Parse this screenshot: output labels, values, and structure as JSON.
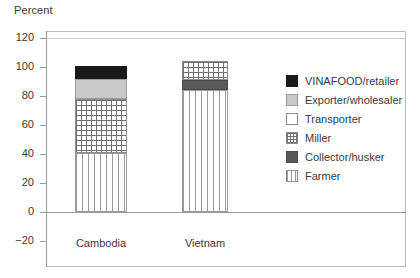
{
  "axis_title": "Percent",
  "chart_data": {
    "type": "bar",
    "title": "",
    "xlabel": "",
    "ylabel": "Percent",
    "ylim": [
      -20,
      120
    ],
    "grid": false,
    "stacked": true,
    "legend_position": "right",
    "categories": [
      "Cambodia",
      "Vietnam"
    ],
    "yticks": [
      "120",
      "100",
      "80",
      "60",
      "40",
      "20",
      "0",
      "−20"
    ],
    "ytick_values": [
      120,
      100,
      80,
      60,
      40,
      20,
      0,
      -20
    ],
    "series": [
      {
        "name": "Farmer",
        "values": [
          41,
          84
        ]
      },
      {
        "name": "Collector/husker",
        "values": [
          0,
          7
        ]
      },
      {
        "name": "Miller",
        "values": [
          37,
          13
        ]
      },
      {
        "name": "Transporter",
        "values": [
          0,
          0
        ]
      },
      {
        "name": "Exporter/wholesaler",
        "values": [
          14,
          0
        ]
      },
      {
        "name": "VINAFOOD/retailer",
        "values": [
          9,
          0
        ]
      }
    ],
    "totals": [
      101,
      104
    ]
  },
  "legend": {
    "items": [
      {
        "label": "VINAFOOD/retailer",
        "key": "vinafood",
        "color": "#191919"
      },
      {
        "label": "Exporter/wholesaler",
        "key": "exporter",
        "color": "#c9c9c9"
      },
      {
        "label": "Transporter",
        "key": "transporter",
        "color": "#ffffff"
      },
      {
        "label": "Miller",
        "key": "miller",
        "color": "#ffffff"
      },
      {
        "label": "Collector/husker",
        "key": "collector",
        "color": "#595959"
      },
      {
        "label": "Farmer",
        "key": "farmer",
        "color": "#ffffff"
      }
    ]
  },
  "ticks": [
    {
      "label": "120",
      "top": 38
    },
    {
      "label": "100",
      "top": 67
    },
    {
      "label": "80",
      "top": 96
    },
    {
      "label": "60",
      "top": 125
    },
    {
      "label": "40",
      "top": 154
    },
    {
      "label": "20",
      "top": 183
    },
    {
      "label": "0",
      "top": 212
    },
    {
      "label": "−20",
      "top": 241
    }
  ],
  "bars": [
    {
      "category": "Cambodia",
      "left": 75,
      "width": 52,
      "label_left": 61,
      "label_width": 80,
      "segments": [
        {
          "key": "vinafood",
          "name": "VINAFOOD/retailer",
          "from": 92,
          "to": 101
        },
        {
          "key": "exporter",
          "name": "Exporter/wholesaler",
          "from": 78,
          "to": 92
        },
        {
          "key": "miller",
          "name": "Miller",
          "from": 41,
          "to": 78
        },
        {
          "key": "farmer",
          "name": "Farmer",
          "from": 0,
          "to": 41
        }
      ]
    },
    {
      "category": "Vietnam",
      "left": 182,
      "width": 46,
      "label_left": 170,
      "label_width": 70,
      "segments": [
        {
          "key": "miller",
          "name": "Miller",
          "from": 91,
          "to": 104
        },
        {
          "key": "collector",
          "name": "Collector/husker",
          "from": 84,
          "to": 91
        },
        {
          "key": "farmer",
          "name": "Farmer",
          "from": 0,
          "to": 84
        }
      ]
    }
  ]
}
